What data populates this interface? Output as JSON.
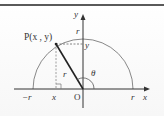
{
  "diagram": {
    "type": "unit-circle-polar",
    "labels": {
      "y_axis": "y",
      "x_axis": "x",
      "top_r": "r",
      "point": "P(x , y)",
      "y_tick": "y",
      "radius": "r",
      "angle": "θ",
      "neg_r": "−r",
      "x_tick": "x",
      "origin": "O",
      "pos_r": "r"
    },
    "colors": {
      "border": "#555555",
      "axis": "#333333",
      "arc": "#777777",
      "segment": "#222222",
      "dashed": "#666666"
    }
  }
}
